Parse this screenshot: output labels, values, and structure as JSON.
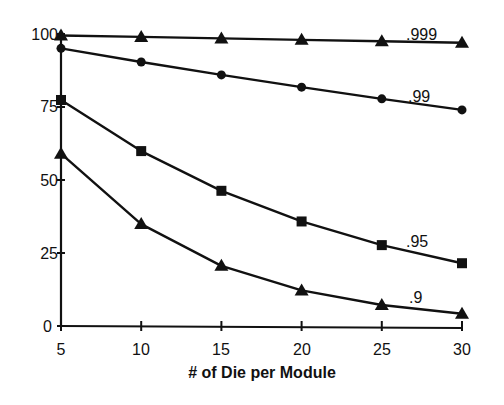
{
  "chart_data": {
    "type": "line",
    "title": "",
    "xlabel": "# of Die per Module",
    "ylabel": "",
    "x": [
      5,
      10,
      15,
      20,
      25,
      30
    ],
    "xlim": [
      5,
      30
    ],
    "ylim": [
      0,
      100
    ],
    "xticks": [
      "5",
      "10",
      "15",
      "20",
      "25",
      "30"
    ],
    "yticks": [
      "0",
      "25",
      "50",
      "75",
      "100"
    ],
    "grid": false,
    "legend": "inline labels at right end of each curve",
    "series": [
      {
        "name": ".999",
        "marker": "triangle",
        "values": [
          99.5,
          99.0,
          98.5,
          98.0,
          97.5,
          97.0
        ]
      },
      {
        "name": ".99",
        "marker": "circle",
        "values": [
          95.1,
          90.4,
          86.0,
          81.8,
          77.8,
          74.0
        ]
      },
      {
        "name": ".95",
        "marker": "square",
        "values": [
          77.4,
          59.9,
          46.3,
          35.8,
          27.7,
          21.5
        ]
      },
      {
        "name": ".9",
        "marker": "triangle",
        "values": [
          59.0,
          34.9,
          20.6,
          12.2,
          7.2,
          4.2
        ]
      }
    ]
  },
  "labels": {
    "xlabel": "# of Die per Module",
    "series_999": ".999",
    "series_99": ".99",
    "series_95": ".95",
    "series_9": ".9",
    "y0": "0",
    "y25": "25",
    "y50": "50",
    "y75": "75",
    "y100": "100",
    "x5": "5",
    "x10": "10",
    "x15": "15",
    "x20": "20",
    "x25": "25",
    "x30": "30"
  }
}
